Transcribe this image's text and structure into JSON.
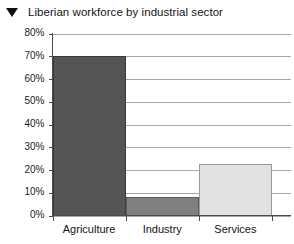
{
  "title": {
    "marker_icon": "triangle-down-icon",
    "text": "Liberian workforce by industrial sector"
  },
  "chart_data": {
    "type": "bar",
    "title": "Liberian workforce by industrial sector",
    "xlabel": "",
    "ylabel": "",
    "categories": [
      "Agriculture",
      "Industry",
      "Services"
    ],
    "values": [
      70,
      8,
      22.5
    ],
    "value_labels": [
      "70%",
      "8%",
      "22.5%"
    ],
    "ylim": [
      0,
      80
    ],
    "ytick_labels": [
      "0%",
      "10%",
      "20%",
      "30%",
      "40%",
      "50%",
      "60%",
      "70%",
      "80%"
    ],
    "ytick_values": [
      0,
      10,
      20,
      30,
      40,
      50,
      60,
      70,
      80
    ],
    "grid": true,
    "legend": false,
    "bar_colors": [
      "#555555",
      "#808080",
      "#e2e2e2"
    ],
    "bar_border_colors": [
      "#3a3a3a",
      "#5e5e5e",
      "#9a9a9a"
    ],
    "grid_color": "#a8a8a8",
    "axis_color": "#4a4a4a",
    "background": "#ffffff"
  }
}
